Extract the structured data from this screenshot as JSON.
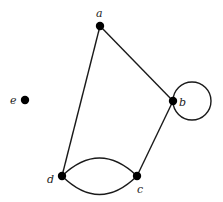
{
  "diagram": {
    "type": "graph",
    "nodes": [
      {
        "id": "a",
        "label": "a"
      },
      {
        "id": "b",
        "label": "b"
      },
      {
        "id": "c",
        "label": "c"
      },
      {
        "id": "d",
        "label": "d"
      },
      {
        "id": "e",
        "label": "e"
      }
    ],
    "edges": [
      {
        "from": "a",
        "to": "b"
      },
      {
        "from": "a",
        "to": "d"
      },
      {
        "from": "b",
        "to": "c"
      },
      {
        "from": "c",
        "to": "d",
        "curve": "upper"
      },
      {
        "from": "c",
        "to": "d",
        "curve": "lower"
      },
      {
        "from": "b",
        "to": "b",
        "type": "loop"
      }
    ],
    "colors": {
      "node": "#000000",
      "edge": "#1a1a1a",
      "background": "#ffffff"
    }
  }
}
